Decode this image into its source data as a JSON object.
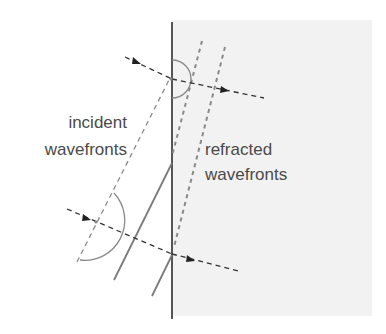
{
  "diagram": {
    "type": "refraction-wavefront-diagram",
    "labels": {
      "incident_line1": "incident",
      "incident_line2": "wavefronts",
      "refracted_line1": "refracted",
      "refracted_line2": "wavefronts"
    },
    "colors": {
      "background": "#ffffff",
      "medium": "#f2f2f2",
      "boundary": "#555555",
      "wavefront_solid": "#7a7a7a",
      "dashed_wavefront": "#8a8a8a",
      "ray": "#333333",
      "arc": "#888888",
      "text": "#4a4a4a"
    }
  }
}
